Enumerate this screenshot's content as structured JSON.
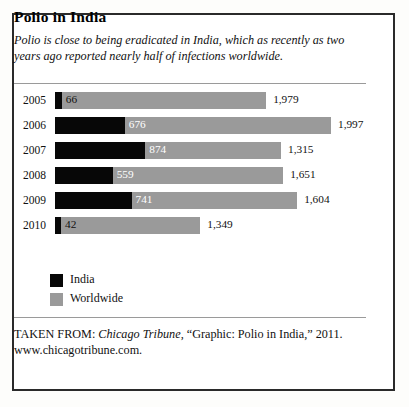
{
  "figure": {
    "title": "Polio in India",
    "subtitle": "Polio is close to being eradicated in India, which as recently as two years ago reported nearly half of infections worldwide."
  },
  "source": {
    "prefix": "TAKEN FROM: ",
    "publication": "Chicago Tribune",
    "rest": ", “Graphic: Polio in India,” 2011.",
    "url": "www.chicagotribune.com."
  },
  "legend": {
    "items": [
      {
        "label": "India",
        "color": "#070707"
      },
      {
        "label": "Worldwide",
        "color": "#9a9a9a"
      }
    ]
  },
  "chart_data": {
    "type": "bar",
    "subtype": "stacked-horizontal",
    "title": "Polio in India",
    "subtitle": "Polio is close to being eradicated in India, which as recently as two years ago reported nearly half of infections worldwide.",
    "xlabel": "",
    "ylabel": "",
    "grid": false,
    "legend_position": "below-plot-left",
    "orientation": "horizontal",
    "categories": [
      "2005",
      "2006",
      "2007",
      "2008",
      "2009",
      "2010"
    ],
    "series": [
      {
        "name": "India",
        "color": "#070707",
        "values": [
          66,
          676,
          874,
          559,
          741,
          42
        ]
      },
      {
        "name": "Worldwide",
        "color": "#9a9a9a",
        "values": [
          1979,
          1997,
          1315,
          1651,
          1604,
          1349
        ]
      }
    ],
    "value_labels": {
      "India": [
        "66",
        "676",
        "874",
        "559",
        "741",
        "42"
      ],
      "Worldwide": [
        "1,979",
        "1,997",
        "1,315",
        "1,651",
        "1,604",
        "1,349"
      ]
    },
    "xlim": [
      0,
      1997
    ]
  },
  "rows": [
    {
      "year": "2005",
      "india": 66,
      "world": 1979,
      "india_label": "66",
      "world_label": "1,979"
    },
    {
      "year": "2006",
      "india": 676,
      "world": 1997,
      "india_label": "676",
      "world_label": "1,997"
    },
    {
      "year": "2007",
      "india": 874,
      "world": 1315,
      "india_label": "874",
      "world_label": "1,315"
    },
    {
      "year": "2008",
      "india": 559,
      "world": 1651,
      "india_label": "559",
      "world_label": "1,651"
    },
    {
      "year": "2009",
      "india": 741,
      "world": 1604,
      "india_label": "741",
      "world_label": "1,604"
    },
    {
      "year": "2010",
      "india": 42,
      "world": 1349,
      "india_label": "42",
      "world_label": "1,349"
    }
  ]
}
